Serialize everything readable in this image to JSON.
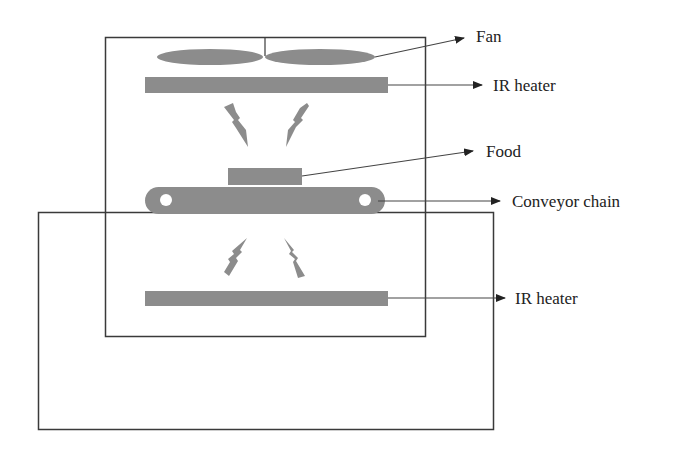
{
  "diagram": {
    "type": "IR heating oven schematic",
    "colors": {
      "component_fill": "#8c8c8c",
      "outline": "#3a3a3a",
      "text": "#222222",
      "background": "#ffffff"
    },
    "labels": {
      "fan": "Fan",
      "ir_heater_top": "IR heater",
      "food": "Food",
      "conveyor_chain": "Conveyor chain",
      "ir_heater_bottom": "IR heater"
    },
    "components": [
      {
        "id": "fan",
        "shape": "two-blade ellipse fan"
      },
      {
        "id": "ir_heater_top",
        "shape": "rectangle bar"
      },
      {
        "id": "radiation_top",
        "shape": "two lightning bolts pointing down"
      },
      {
        "id": "food",
        "shape": "rectangle"
      },
      {
        "id": "conveyor_chain",
        "shape": "rounded bar with two rollers"
      },
      {
        "id": "radiation_bottom",
        "shape": "two lightning bolts pointing up"
      },
      {
        "id": "ir_heater_bottom",
        "shape": "rectangle bar"
      }
    ]
  }
}
